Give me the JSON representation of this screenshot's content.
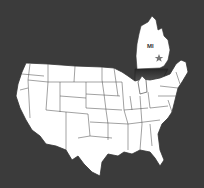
{
  "map": {
    "title": "United States map with Michigan highlighted",
    "highlight_state": {
      "label": "MI",
      "name": "Michigan",
      "marker": "star-icon"
    },
    "colors": {
      "background": "#3b3b3b",
      "land": "#ffffff",
      "borders": "#3a3a3a",
      "marker": "#777777"
    }
  }
}
